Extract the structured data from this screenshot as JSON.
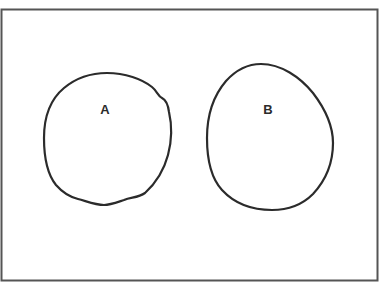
{
  "diagram": {
    "type": "venn",
    "universal_set": {
      "label": "",
      "border_color": "#555555",
      "x": 1,
      "y": 9,
      "width": 376,
      "height": 271
    },
    "sets": [
      {
        "label": "A",
        "label_x": 105,
        "label_y": 114,
        "stroke": "#2b2b2b",
        "path": "M 107 73 C 125 73 142 79 152 87 C 157 91 158 96 162 98 C 166 100 168 104 169 112 C 172 125 172 140 168 155 C 164 170 156 183 145 193 C 138 198 131 197 124 200 C 115 203 110 205 104 205 C 95 205 86 201 78 199 C 70 197 63 193 56 185 C 48 175 44 160 44 138 C 44 115 52 98 64 88 C 76 78 92 73 107 73 Z"
      },
      {
        "label": "B",
        "label_x": 268,
        "label_y": 114,
        "stroke": "#2b2b2b",
        "path": "M 261 64 C 281 64 300 77 313 93 C 326 110 333 126 333 143 C 333 162 326 180 313 194 C 302 205 287 210 272 210 C 252 210 234 203 222 190 C 211 178 207 160 207 138 C 207 115 214 95 226 81 C 236 70 248 64 261 64 Z"
      }
    ],
    "relationship": "disjoint"
  }
}
